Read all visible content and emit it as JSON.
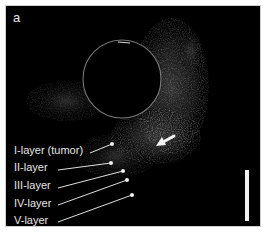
{
  "figure": {
    "panel_label": "a",
    "layers": [
      {
        "label": "I-layer (tumor)",
        "text_x": 8,
        "text_y": 138,
        "line": [
          84,
          147,
          106,
          138
        ],
        "dot": [
          106,
          138
        ]
      },
      {
        "label": "II-layer",
        "text_x": 8,
        "text_y": 155,
        "line": [
          52,
          164,
          105,
          157
        ],
        "dot": [
          105,
          157
        ]
      },
      {
        "label": "III-layer",
        "text_x": 8,
        "text_y": 173,
        "line": [
          52,
          182,
          117,
          165
        ],
        "dot": [
          117,
          165
        ]
      },
      {
        "label": "IV-layer",
        "text_x": 8,
        "text_y": 191,
        "line": [
          52,
          199,
          121,
          174
        ],
        "dot": [
          121,
          174
        ]
      },
      {
        "label": "V-layer",
        "text_x": 8,
        "text_y": 208,
        "line": [
          52,
          216,
          126,
          189
        ],
        "dot": [
          126,
          189
        ]
      }
    ],
    "annotations": {
      "arrow_icon": "white-arrow-pointing-left-down",
      "scale_bar": "vertical-scale-bar"
    },
    "colors": {
      "background": "#000000",
      "text": "#e6e6e6",
      "frame_border": "#cfcfcf",
      "lumen_ring": "#9a9a9a"
    }
  }
}
